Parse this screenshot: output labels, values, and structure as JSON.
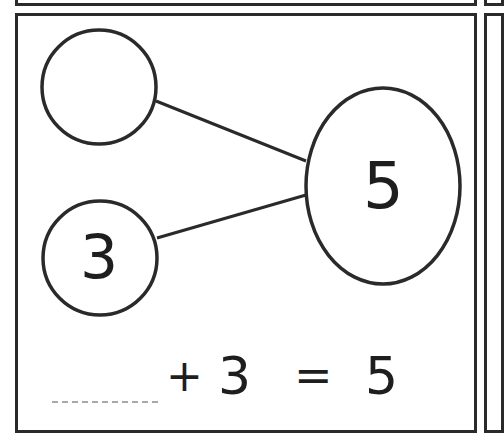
{
  "number_bond": {
    "part_a": "",
    "part_b": "3",
    "whole": "5"
  },
  "equation": {
    "blank": "",
    "plus": "+",
    "addend": "3",
    "equals": "=",
    "sum": "5"
  },
  "colors": {
    "stroke": "#2a2a2a",
    "blank_line": "#a8a8a8"
  }
}
